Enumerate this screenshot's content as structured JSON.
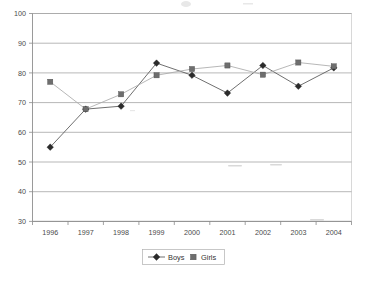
{
  "chart_data": {
    "type": "line",
    "title": "",
    "subtitle": "",
    "xlabel": "",
    "ylabel": "",
    "categories": [
      "1996",
      "1997",
      "1998",
      "1999",
      "2000",
      "2001",
      "2002",
      "2003",
      "2004"
    ],
    "series": [
      {
        "name": "Boys",
        "marker": "diamond",
        "color": "#2b2b2b",
        "values": [
          55.0,
          67.8,
          68.8,
          83.3,
          79.2,
          73.2,
          82.5,
          75.5,
          81.7
        ]
      },
      {
        "name": "Girls",
        "marker": "square",
        "color": "#6e6e6e",
        "values": [
          77.0,
          67.8,
          72.8,
          79.2,
          81.3,
          82.5,
          79.4,
          83.5,
          82.2
        ]
      }
    ],
    "ylim": [
      30,
      100
    ],
    "y_ticks": [
      30,
      40,
      50,
      60,
      70,
      80,
      90,
      100
    ],
    "y_tick_labels": [
      "30",
      "40",
      "50",
      "60",
      "70",
      "80",
      "90",
      "100"
    ],
    "grid": true,
    "grid_axis": "y",
    "legend": {
      "position": "bottom-center",
      "entries": [
        "Boys",
        "Girls"
      ]
    }
  }
}
